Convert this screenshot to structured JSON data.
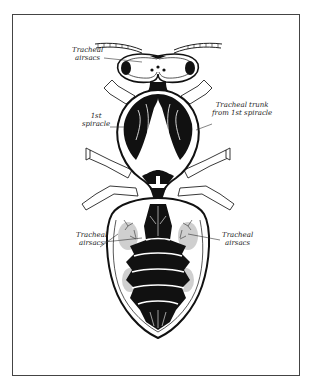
{
  "figure": {
    "colors": {
      "ink": "#111111",
      "paper": "#ffffff",
      "frame": "#444444",
      "stipple": "#bbbbbb"
    },
    "labels": {
      "head_airsacs": {
        "line1": "Tracheal",
        "line2": "airsacs"
      },
      "trunk": {
        "line1": "Tracheal trunk",
        "line2": "from 1st spiracle"
      },
      "spiracle": {
        "line1": "1st",
        "line2": "spiracle"
      },
      "abdomen_left": {
        "line1": "Tracheal",
        "line2": "airsacs"
      },
      "abdomen_right": {
        "line1": "Tracheal",
        "line2": "airsacs"
      }
    }
  }
}
